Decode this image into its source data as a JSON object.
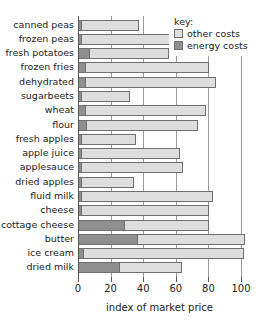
{
  "chart_data": {
    "type": "bar",
    "orientation": "horizontal",
    "stacked": true,
    "title": "",
    "xlabel": "index of market price",
    "ylabel": "",
    "xlim": [
      0,
      105
    ],
    "xticks": [
      0,
      20,
      40,
      60,
      80,
      100
    ],
    "xticklabels": [
      "0",
      "20",
      "40",
      "60",
      "80",
      "100"
    ],
    "grid": "vertical",
    "categories": [
      "canned peas",
      "frozen peas",
      "fresh potatoes",
      "frozen fries",
      "dehydrated",
      "sugarbeets",
      "wheat",
      "flour",
      "fresh apples",
      "apple juice",
      "applesauce",
      "dried apples",
      "fluid milk",
      "cheese",
      "cottage cheese",
      "butter",
      "ice cream",
      "dried milk"
    ],
    "series": [
      {
        "name": "energy costs",
        "color": "#8f8f8f",
        "values": [
          2,
          2,
          7,
          4,
          4,
          2,
          4,
          5,
          2,
          2,
          2,
          2,
          2,
          2,
          28,
          36,
          3,
          25
        ]
      },
      {
        "name": "other costs",
        "color": "#dedede",
        "values": [
          35,
          54,
          48,
          76,
          80,
          29,
          74,
          68,
          33,
          60,
          62,
          32,
          80,
          78,
          52,
          66,
          98,
          38
        ]
      }
    ],
    "totals": [
      37,
      56,
      55,
      80,
      84,
      31,
      78,
      73,
      35,
      62,
      64,
      34,
      82,
      80,
      80,
      102,
      101,
      63
    ],
    "legend": {
      "position": "top-right",
      "title": "key:",
      "entries": [
        {
          "label": "other costs",
          "swatch": "other"
        },
        {
          "label": "energy costs",
          "swatch": "energy"
        }
      ]
    }
  }
}
